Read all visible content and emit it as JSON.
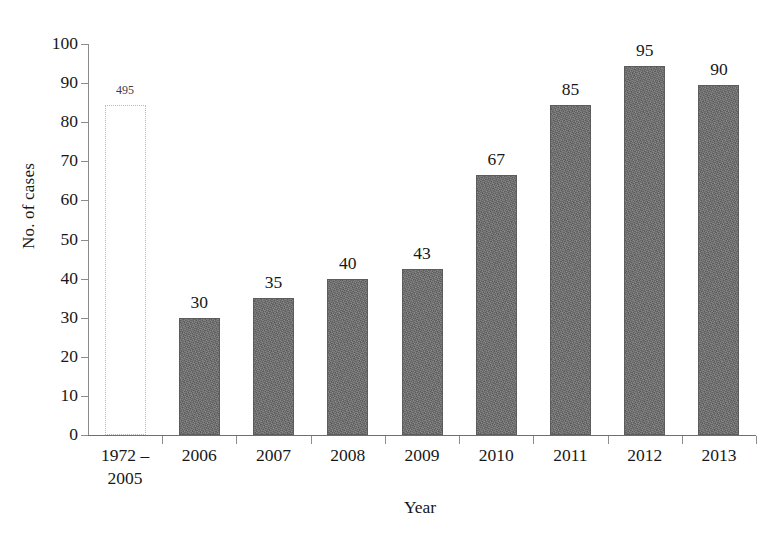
{
  "chart_data": {
    "type": "bar",
    "title": "",
    "subtitle": "",
    "xlabel": "Year",
    "ylabel": "No. of cases",
    "categories": [
      "1972 – 2005",
      "2006",
      "2007",
      "2008",
      "2009",
      "2010",
      "2011",
      "2012",
      "2013"
    ],
    "category_lines": [
      [
        "1972 –",
        "2005"
      ],
      [
        "2006"
      ],
      [
        "2007"
      ],
      [
        "2008"
      ],
      [
        "2009"
      ],
      [
        "2010"
      ],
      [
        "2011"
      ],
      [
        "2012"
      ],
      [
        "2013"
      ]
    ],
    "values": [
      495,
      30,
      35,
      40,
      43,
      67,
      85,
      95,
      90
    ],
    "plotted_heights": [
      84.4,
      30,
      35,
      40,
      42.5,
      66.5,
      84.5,
      94.5,
      89.5
    ],
    "data_labels": [
      "495",
      "30",
      "35",
      "40",
      "43",
      "67",
      "85",
      "95",
      "90"
    ],
    "bar_styles": [
      "outlined-dotted",
      "filled",
      "filled",
      "filled",
      "filled",
      "filled",
      "filled",
      "filled",
      "filled"
    ],
    "ylim": [
      0,
      100
    ],
    "ytick_values": [
      0,
      10,
      20,
      30,
      40,
      50,
      60,
      70,
      80,
      90,
      100
    ],
    "ytick_labels": [
      "0",
      "10",
      "20",
      "30",
      "40",
      "50",
      "60",
      "70",
      "80",
      "90",
      "100"
    ],
    "grid": false,
    "legend": null,
    "legend_position": "none",
    "note": "First bar is drawn truncated with a dotted outline; its true value 495 exceeds the axis maximum.",
    "colors": {
      "bar_fill": "#6e6e6e",
      "bar_stroke": "#5c5c5c",
      "outlined_bar_stroke": "#b9b9b9",
      "axis": "#8b8b8b",
      "text": "#171717",
      "background": "#ffffff"
    }
  }
}
